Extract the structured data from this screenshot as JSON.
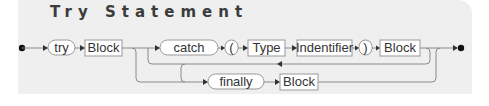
{
  "title": "Try Statement",
  "diagram": {
    "type": "railroad-syntax-diagram",
    "nodes": [
      {
        "id": "try",
        "kind": "terminal",
        "label": "try"
      },
      {
        "id": "block1",
        "kind": "nonterminal",
        "label": "Block"
      },
      {
        "id": "catch",
        "kind": "terminal",
        "label": "catch"
      },
      {
        "id": "lparen",
        "kind": "terminal",
        "label": "("
      },
      {
        "id": "type",
        "kind": "nonterminal",
        "label": "Type"
      },
      {
        "id": "identifier",
        "kind": "nonterminal",
        "label": "Indentifier"
      },
      {
        "id": "rparen",
        "kind": "terminal",
        "label": ")"
      },
      {
        "id": "block2",
        "kind": "nonterminal",
        "label": "Block"
      },
      {
        "id": "finally",
        "kind": "terminal",
        "label": "finally"
      },
      {
        "id": "block3",
        "kind": "nonterminal",
        "label": "Block"
      }
    ],
    "paths": [
      "start -> try -> block1",
      "block1 -> catch -> lparen -> type -> identifier -> rparen -> block2 -> end",
      "block2 -> (loop back) -> catch",
      "block2 -> (loop back) -> finally -> block3 -> end",
      "block1 -> finally -> block3 -> end"
    ]
  }
}
